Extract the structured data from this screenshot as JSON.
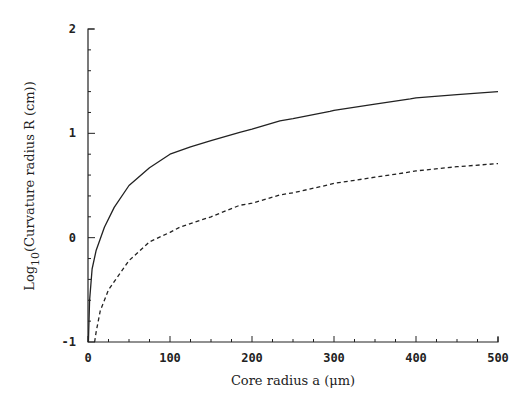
{
  "chart_data": {
    "type": "line",
    "title": "",
    "xlabel": "Core radius a (μm)",
    "ylabel": "Log10(Curvature radius R (cm))",
    "ylabel_parts": {
      "main": "Log",
      "sub": "10",
      "rest": "(Curvature radius R (cm))"
    },
    "xlim": [
      0,
      500
    ],
    "ylim": [
      -1,
      2
    ],
    "x_ticks": [
      0,
      100,
      200,
      300,
      400,
      500
    ],
    "x_tick_labels": [
      "0",
      "100",
      "200",
      "300",
      "400",
      "500"
    ],
    "x_minor_step": 25,
    "y_ticks": [
      -1,
      0,
      1,
      2
    ],
    "y_tick_labels": [
      "-1",
      "0",
      "1",
      "2"
    ],
    "y_minor_step": 0.2,
    "grid": false,
    "legend": null,
    "series": [
      {
        "name": "solid curve",
        "style": "solid",
        "x": [
          0.5,
          2,
          5,
          10,
          20,
          32,
          50,
          75,
          100,
          125,
          150,
          185,
          200,
          234,
          250,
          295,
          300,
          350,
          393,
          400,
          450,
          500
        ],
        "y": [
          -1.0,
          -0.6,
          -0.3,
          -0.12,
          0.1,
          0.29,
          0.5,
          0.67,
          0.8,
          0.87,
          0.93,
          1.01,
          1.04,
          1.12,
          1.14,
          1.21,
          1.22,
          1.28,
          1.33,
          1.34,
          1.37,
          1.4
        ]
      },
      {
        "name": "dashed curve",
        "style": "dashed",
        "x": [
          8,
          10,
          15,
          25,
          50,
          75,
          100,
          112,
          150,
          185,
          200,
          234,
          250,
          295,
          300,
          350,
          393,
          400,
          450,
          500
        ],
        "y": [
          -1.0,
          -0.9,
          -0.7,
          -0.5,
          -0.22,
          -0.04,
          0.05,
          0.1,
          0.2,
          0.31,
          0.33,
          0.41,
          0.43,
          0.51,
          0.52,
          0.58,
          0.63,
          0.64,
          0.68,
          0.71
        ]
      }
    ]
  },
  "colors": {
    "axis": "#222222",
    "line": "#222222",
    "background": "#ffffff"
  }
}
